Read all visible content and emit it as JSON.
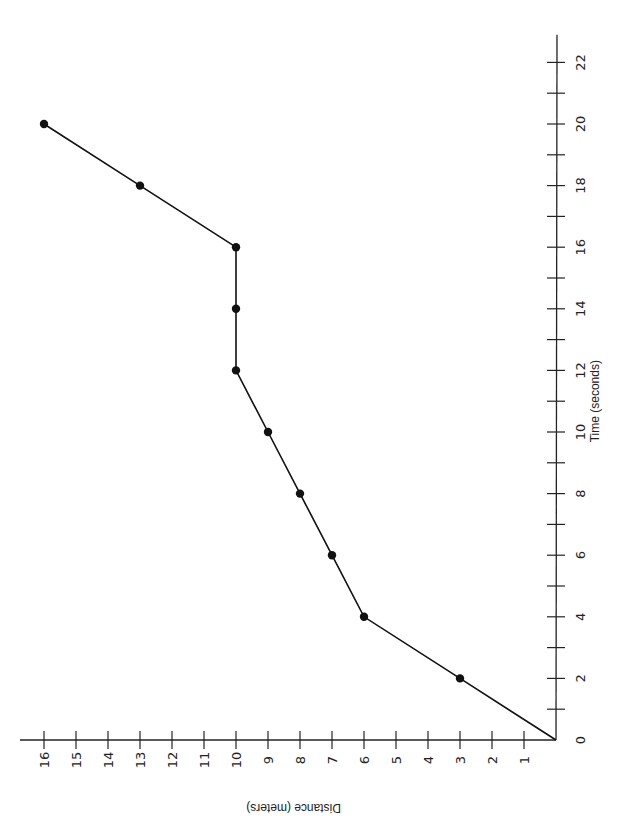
{
  "chart_data": {
    "type": "line",
    "title": "",
    "xlabel": "Time (seconds)",
    "ylabel": "Distance (meters)",
    "x": [
      0,
      2,
      4,
      6,
      8,
      10,
      12,
      14,
      16,
      18,
      20
    ],
    "series": [
      {
        "name": "Distance",
        "values": [
          0,
          3,
          6,
          7,
          8,
          9,
          10,
          10,
          10,
          13,
          16
        ]
      }
    ],
    "xlim": [
      0,
      22
    ],
    "ylim": [
      0,
      16
    ],
    "x_ticks": [
      0,
      2,
      4,
      6,
      8,
      10,
      12,
      14,
      16,
      18,
      20,
      22
    ],
    "y_ticks": [
      1,
      2,
      3,
      4,
      5,
      6,
      7,
      8,
      9,
      10,
      11,
      12,
      13,
      14,
      15,
      16
    ],
    "grid": false,
    "legend": "none",
    "markers": "filled-circle",
    "orientation": "rotated 90 degrees clockwise"
  },
  "colors": {
    "line": "#111111",
    "axis": "#222222",
    "background": "#ffffff"
  }
}
